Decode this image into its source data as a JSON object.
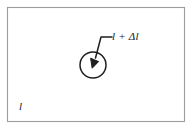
{
  "figure": {
    "title": "",
    "frame": {
      "stroke_color": "#9a9a9a",
      "fill_color": "#ffffff",
      "x": 7,
      "y": 7,
      "width": 178,
      "height": 115
    },
    "circle": {
      "name": "deformed-region-circle",
      "stroke_color": "#1a1a1a",
      "center_x": 93,
      "center_y": 65,
      "radius": 13
    },
    "arrow": {
      "name": "leader-arrow",
      "stroke_color": "#1a1a1a",
      "tip_x": 93,
      "tip_y": 65,
      "bend_x": 101,
      "bend_y": 37,
      "end_x": 112,
      "end_y": 37
    },
    "labels": {
      "deformed_length": "l + Δl",
      "original_length": "l"
    }
  }
}
